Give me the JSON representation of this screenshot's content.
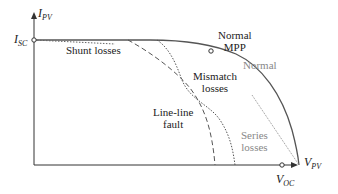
{
  "diagram": {
    "axes": {
      "y_label": "I",
      "y_sub": "PV",
      "x_label": "V",
      "x_sub": "PV",
      "isc_label": "I",
      "isc_sub": "SC",
      "voc_label": "V",
      "voc_sub": "OC"
    },
    "labels": {
      "shunt": "Shunt losses",
      "normal_mpp_line1": "Normal",
      "normal_mpp_line2": "MPP",
      "normal": "Normal",
      "mismatch_line1": "Mismatch",
      "mismatch_line2": "losses",
      "lineline_line1": "Line-line",
      "lineline_line2": "fault",
      "series_line1": "Series",
      "series_line2": "losses"
    },
    "colors": {
      "curve": "#555555",
      "gray_text": "#888888",
      "axis": "#333333"
    }
  }
}
